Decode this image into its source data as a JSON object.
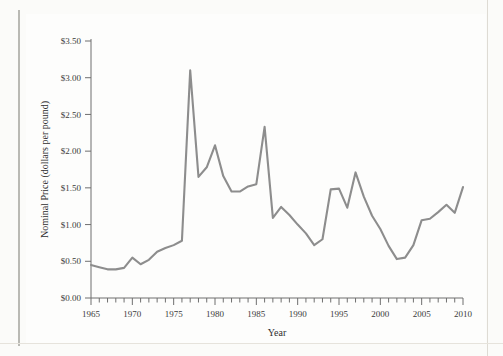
{
  "figure": {
    "background_color": "#fdfdfc",
    "line_color": "#8d8d8d",
    "axis_color": "#6f6f6f",
    "text_color": "#2e2e2e"
  },
  "chart_data": {
    "type": "line",
    "title": "",
    "xlabel": "Year",
    "ylabel": "Nominal Price (dollars per pound)",
    "xlim": [
      1965,
      2010
    ],
    "ylim": [
      0.0,
      3.5
    ],
    "grid": false,
    "legend": null,
    "x_tick_labels": [
      "1965",
      "1970",
      "1975",
      "1980",
      "1985",
      "1990",
      "1995",
      "2000",
      "2005",
      "2010"
    ],
    "x_tick_values": [
      1965,
      1970,
      1975,
      1980,
      1985,
      1990,
      1995,
      2000,
      2005,
      2010
    ],
    "x_minor_tick_step": 1,
    "y_tick_labels": [
      "$0.00",
      "$0.50",
      "$1.00",
      "$1.50",
      "$2.00",
      "$2.50",
      "$3.00",
      "$3.50"
    ],
    "y_tick_values": [
      0.0,
      0.5,
      1.0,
      1.5,
      2.0,
      2.5,
      3.0,
      3.5
    ],
    "series": [
      {
        "name": "Nominal Price",
        "x": [
          1965,
          1966,
          1967,
          1968,
          1969,
          1970,
          1971,
          1972,
          1973,
          1974,
          1975,
          1976,
          1977,
          1978,
          1979,
          1980,
          1981,
          1982,
          1983,
          1984,
          1985,
          1986,
          1987,
          1988,
          1989,
          1990,
          1991,
          1992,
          1993,
          1994,
          1995,
          1996,
          1997,
          1998,
          1999,
          2000,
          2001,
          2002,
          2003,
          2004,
          2005,
          2006,
          2007,
          2008,
          2009,
          2010
        ],
        "values": [
          0.45,
          0.42,
          0.39,
          0.39,
          0.41,
          0.55,
          0.46,
          0.52,
          0.63,
          0.68,
          0.72,
          0.78,
          3.1,
          1.65,
          1.78,
          2.08,
          1.66,
          1.45,
          1.45,
          1.52,
          1.55,
          2.33,
          1.09,
          1.24,
          1.13,
          1.0,
          0.88,
          0.72,
          0.8,
          1.48,
          1.49,
          1.23,
          1.71,
          1.38,
          1.12,
          0.94,
          0.71,
          0.53,
          0.55,
          0.72,
          1.06,
          1.08,
          1.17,
          1.27,
          1.16,
          1.51
        ]
      }
    ]
  }
}
